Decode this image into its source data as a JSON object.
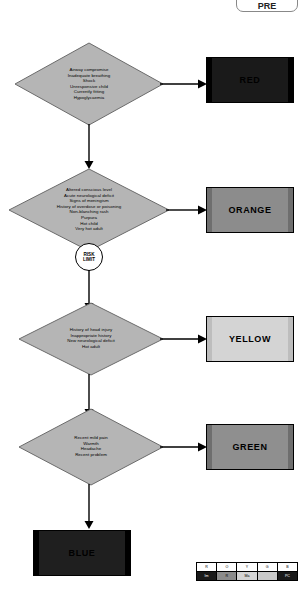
{
  "diagram": {
    "title_pill": "PRE",
    "risk_marker": {
      "line1": "RISK",
      "line2": "LIMIT"
    },
    "nodes": [
      {
        "id": "red-criteria",
        "criteria": [
          "Airway compromise",
          "Inadequate breathing",
          "Shock",
          "Unresponsive child",
          "Currently fitting",
          "Hypoglycaemia"
        ],
        "outcome_label": "RED",
        "outcome_color": "#1a1a1a",
        "outcome_text_color": "#000000",
        "outcome_side_color": "#000000"
      },
      {
        "id": "orange-criteria",
        "criteria": [
          "Altered conscious level",
          "Acute neurological deficit",
          "Signs of meningism",
          "History of overdose or poisoning",
          "Non-blanching rash",
          "Purpura",
          "Hot child",
          "Very hot adult"
        ],
        "outcome_label": "ORANGE",
        "outcome_color": "#8c8c8c",
        "outcome_text_color": "#000000",
        "outcome_side_color": "#6e6e6e"
      },
      {
        "id": "yellow-criteria",
        "criteria": [
          "History of head injury",
          "Inappropriate history",
          "New neurological deficit",
          "Hot adult"
        ],
        "outcome_label": "YELLOW",
        "outcome_color": "#d4d4d4",
        "outcome_text_color": "#000000",
        "outcome_side_color": "#bdbdbd"
      },
      {
        "id": "green-criteria",
        "criteria": [
          "Recent mild pain",
          "Warmth",
          "Headache",
          "Recent problem"
        ],
        "outcome_label": "GREEN",
        "outcome_color": "#8f8f8f",
        "outcome_text_color": "#000000",
        "outcome_side_color": "#6e6e6e"
      }
    ],
    "terminal": {
      "label": "BLUE",
      "color": "#1f1f1f",
      "text_color": "#000000",
      "side_color": "#000000"
    },
    "legend": {
      "headers": [
        "R",
        "O",
        "Y",
        "G",
        "B"
      ],
      "values": [
        "Im",
        "R",
        "Ma",
        "",
        "PC"
      ],
      "header_colors": [
        "#ffffff",
        "#ffffff",
        "#ffffff",
        "#ffffff",
        "#ffffff"
      ],
      "value_colors": [
        "#1a1a1a",
        "#8c8c8c",
        "#d4d4d4",
        "#c9c9c9",
        "#1a1a1a"
      ],
      "value_text_colors": [
        "#ffffff",
        "#000000",
        "#000000",
        "#000000",
        "#ffffff"
      ]
    }
  }
}
